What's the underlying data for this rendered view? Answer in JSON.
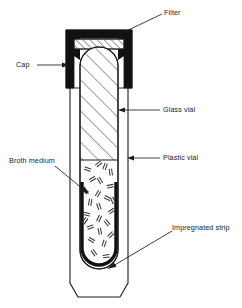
{
  "diagram": {
    "background": "#ffffff",
    "stroke_color": "#1c1c1c",
    "fill_black": "#111111",
    "hatch_color": "#2b2b2b"
  },
  "labels": {
    "filter": "Filter",
    "cap": "Cap",
    "glass_vial": "Glass vial",
    "plastic_vial": "Plastic vial",
    "broth_medium": "Broth medium",
    "impregnated_strip": "Impregnated strip"
  },
  "parts": [
    {
      "name": "filter",
      "label": "Filter",
      "side": "right",
      "leader": "diagonal"
    },
    {
      "name": "cap",
      "label": "Cap",
      "side": "left",
      "leader": "horizontal"
    },
    {
      "name": "glass-vial",
      "label": "Glass vial",
      "side": "right",
      "leader": "horizontal"
    },
    {
      "name": "plastic-vial",
      "label": "Plastic vial",
      "side": "right",
      "leader": "horizontal"
    },
    {
      "name": "broth-medium",
      "label": "Broth medium",
      "side": "left",
      "leader": "diagonal"
    },
    {
      "name": "impregnated-strip",
      "label": "Impregnated strip",
      "side": "right",
      "leader": "diagonal"
    }
  ]
}
